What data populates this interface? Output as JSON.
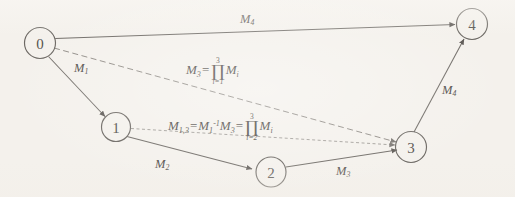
{
  "figure": {
    "type": "directed-graph-diagram",
    "background_color": "#f4f1ec",
    "stroke_color": "#6b6762",
    "width": 515,
    "height": 197
  },
  "nodes": [
    {
      "id": "0",
      "label": "0",
      "cx": 40,
      "cy": 43,
      "r": 15.5
    },
    {
      "id": "1",
      "label": "1",
      "cx": 116,
      "cy": 127,
      "r": 14.5
    },
    {
      "id": "2",
      "label": "2",
      "cx": 271,
      "cy": 172,
      "r": 15.0
    },
    {
      "id": "3",
      "label": "3",
      "cx": 411,
      "cy": 147,
      "r": 15.5
    },
    {
      "id": "4",
      "label": "4",
      "cx": 472,
      "cy": 24,
      "r": 15.5
    }
  ],
  "edges": [
    {
      "from": "0",
      "to": "4",
      "style": "solid",
      "label": "M4",
      "arrow": true
    },
    {
      "from": "0",
      "to": "1",
      "style": "solid",
      "label": "M1",
      "arrow": true
    },
    {
      "from": "1",
      "to": "2",
      "style": "solid",
      "label": "M2",
      "arrow": true
    },
    {
      "from": "2",
      "to": "3",
      "style": "solid",
      "label": "M3",
      "arrow": true
    },
    {
      "from": "3",
      "to": "4",
      "style": "solid",
      "label": "M4r",
      "arrow": true
    },
    {
      "from": "0",
      "to": "3",
      "style": "dashed",
      "label": "F1",
      "arrow": true
    },
    {
      "from": "1",
      "to": "3",
      "style": "dotted",
      "label": "F2",
      "arrow": true
    }
  ],
  "labels": {
    "m4_top": {
      "base": "M",
      "sub": "4"
    },
    "m1_left": {
      "base": "M",
      "sub": "1"
    },
    "m2_bottom": {
      "base": "M",
      "sub": "2"
    },
    "m3_bottom": {
      "base": "M",
      "sub": "3"
    },
    "m4_right": {
      "base": "M",
      "sub": "4"
    }
  },
  "formulas": {
    "edge_0_3": {
      "lhs_base": "M",
      "lhs_sub": "3",
      "equals": "=",
      "product_upper": "3",
      "product_lower": "i=1",
      "operand_base": "M",
      "operand_sub": "i",
      "plain": "M3 = prod(i=1..3) Mi"
    },
    "edge_1_3": {
      "lhs_base": "M",
      "lhs_sub": "1,3",
      "equals_1": "=",
      "term_base": "M",
      "term_sub": "1",
      "term_sup": "-1",
      "term2_base": "M",
      "term2_sub": "3",
      "equals_2": "=",
      "product_upper": "3",
      "product_lower": "i=2",
      "operand_base": "M",
      "operand_sub": "i",
      "plain": "M1,3 = M1^-1 M3 = prod(i=2..3) Mi"
    }
  },
  "glyphs": {
    "product": "∏"
  }
}
